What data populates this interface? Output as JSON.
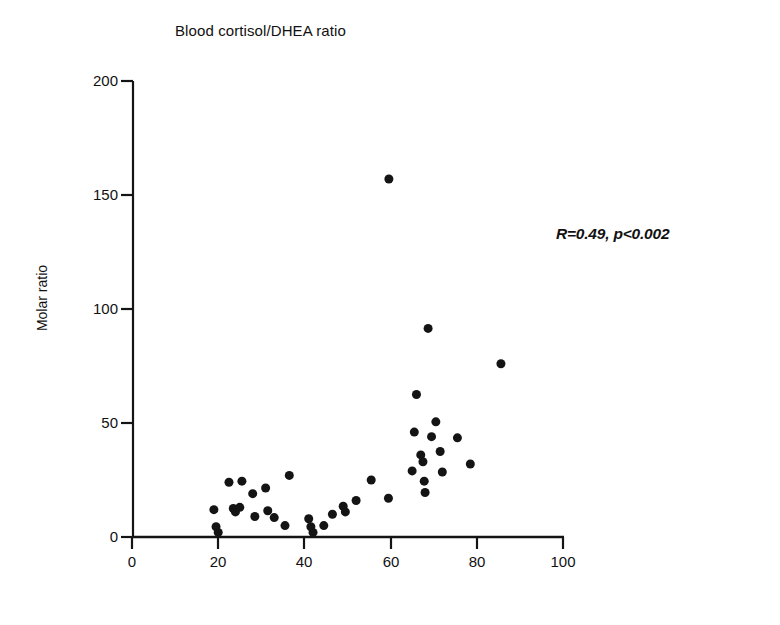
{
  "chart_data": {
    "type": "scatter",
    "title": "Blood cortisol/DHEA ratio",
    "xlabel": "",
    "ylabel": "Molar ratio",
    "xlim": [
      0,
      100
    ],
    "ylim": [
      0,
      200
    ],
    "xticks": [
      0,
      20,
      40,
      60,
      80,
      100
    ],
    "yticks": [
      0,
      50,
      100,
      150,
      200
    ],
    "grid": false,
    "legend": null,
    "annotations": [
      {
        "text": "R=0.49, p<0.002",
        "x": 92,
        "y": 137
      }
    ],
    "marker": {
      "shape": "circle",
      "color": "#141414",
      "size": 9
    },
    "points": [
      {
        "x": 19.0,
        "y": 12.0
      },
      {
        "x": 19.5,
        "y": 4.5
      },
      {
        "x": 20.0,
        "y": 2.0
      },
      {
        "x": 22.5,
        "y": 24.0
      },
      {
        "x": 23.5,
        "y": 12.5
      },
      {
        "x": 24.0,
        "y": 11.0
      },
      {
        "x": 25.5,
        "y": 24.5
      },
      {
        "x": 25.0,
        "y": 13.0
      },
      {
        "x": 28.0,
        "y": 19.0
      },
      {
        "x": 28.5,
        "y": 9.0
      },
      {
        "x": 31.0,
        "y": 21.5
      },
      {
        "x": 31.5,
        "y": 11.5
      },
      {
        "x": 33.0,
        "y": 8.5
      },
      {
        "x": 36.5,
        "y": 27.0
      },
      {
        "x": 35.5,
        "y": 5.0
      },
      {
        "x": 41.0,
        "y": 8.0
      },
      {
        "x": 41.5,
        "y": 4.5
      },
      {
        "x": 42.0,
        "y": 2.0
      },
      {
        "x": 44.5,
        "y": 5.0
      },
      {
        "x": 46.5,
        "y": 10.0
      },
      {
        "x": 49.0,
        "y": 13.5
      },
      {
        "x": 49.5,
        "y": 11.0
      },
      {
        "x": 52.0,
        "y": 16.0
      },
      {
        "x": 55.5,
        "y": 25.0
      },
      {
        "x": 59.6,
        "y": 157.0
      },
      {
        "x": 59.5,
        "y": 17.0
      },
      {
        "x": 65.0,
        "y": 29.0
      },
      {
        "x": 65.5,
        "y": 46.0
      },
      {
        "x": 66.0,
        "y": 62.5
      },
      {
        "x": 67.0,
        "y": 36.0
      },
      {
        "x": 67.5,
        "y": 33.0
      },
      {
        "x": 67.8,
        "y": 24.5
      },
      {
        "x": 68.0,
        "y": 19.5
      },
      {
        "x": 68.7,
        "y": 91.5
      },
      {
        "x": 69.5,
        "y": 44.0
      },
      {
        "x": 70.5,
        "y": 50.5
      },
      {
        "x": 71.5,
        "y": 37.5
      },
      {
        "x": 72.0,
        "y": 28.5
      },
      {
        "x": 75.5,
        "y": 43.5
      },
      {
        "x": 78.5,
        "y": 32.0
      },
      {
        "x": 85.6,
        "y": 76.0
      }
    ]
  },
  "axis": {
    "y_tick_labels": [
      "200",
      "150",
      "100",
      "50",
      "0"
    ],
    "x_tick_labels": [
      "0",
      "20",
      "40",
      "60",
      "80",
      "100"
    ]
  }
}
